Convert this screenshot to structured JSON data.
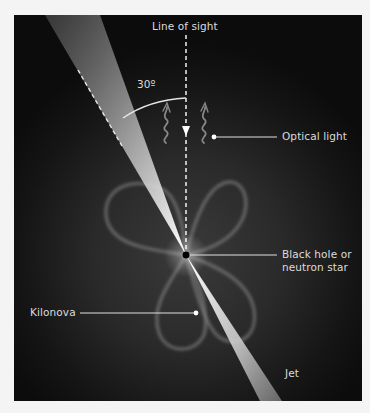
{
  "diagram": {
    "labels": {
      "line_of_sight": "Line of sight",
      "angle": "30º",
      "optical_light": "Optical light",
      "black_hole": "Black hole or neutron star",
      "kilonova": "Kilonova",
      "jet": "Jet"
    },
    "angle_degrees": 30,
    "colors": {
      "background_panel": "#151515",
      "page_background": "#f4f4f4",
      "label_text": "#dcdcdc",
      "jet_core": "#f5f5f5",
      "kilonova_outline": "#7a7a7a",
      "black_hole": "#000000"
    },
    "icons": {
      "optical_light_waves": "wavy-arrow-up-icon"
    }
  }
}
